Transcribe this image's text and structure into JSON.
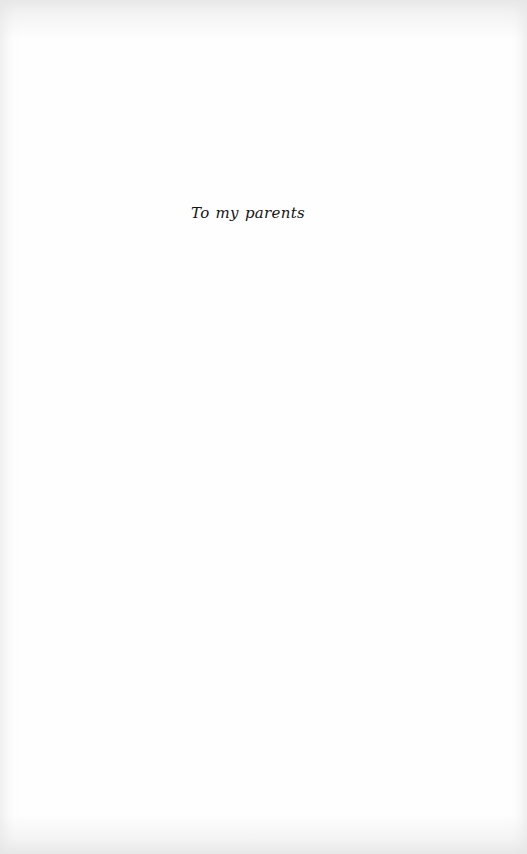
{
  "page": {
    "type": "dedication",
    "dedication_text": "To my parents"
  }
}
